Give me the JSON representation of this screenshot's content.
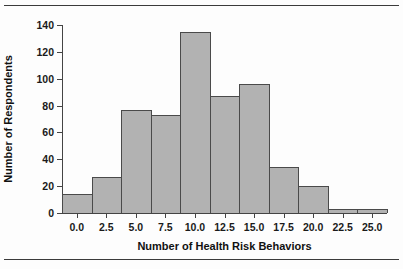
{
  "figure": {
    "background_color": "#fdfdfd",
    "rule_color": "#3b3b3b"
  },
  "chart_data": {
    "type": "bar",
    "title": "",
    "subtitle": "",
    "xlabel": "Number of Health Risk Behaviors",
    "ylabel": "Number of Respondents",
    "bin_width": 2.5,
    "bin_starts": [
      -1.25,
      1.25,
      3.75,
      6.25,
      8.75,
      11.25,
      13.75,
      16.25,
      18.75,
      21.25,
      23.75
    ],
    "bin_centers": [
      0.0,
      2.5,
      5.0,
      7.5,
      10.0,
      12.5,
      15.0,
      17.5,
      20.0,
      22.5,
      25.0
    ],
    "categories": [
      "0.0",
      "2.5",
      "5.0",
      "7.5",
      "10.0",
      "12.5",
      "15.0",
      "17.5",
      "20.0",
      "22.5",
      "25.0"
    ],
    "values": [
      14,
      27,
      77,
      73,
      135,
      87,
      96,
      34,
      20,
      3,
      3
    ],
    "xlim": [
      -1.25,
      26.25
    ],
    "ylim": [
      0,
      140
    ],
    "xticks": [
      0.0,
      2.5,
      5.0,
      7.5,
      10.0,
      12.5,
      15.0,
      17.5,
      20.0,
      22.5,
      25.0
    ],
    "xtick_labels": [
      "0.0",
      "2.5",
      "5.0",
      "7.5",
      "10.0",
      "12.5",
      "15.0",
      "17.5",
      "20.0",
      "22.5",
      "25.0"
    ],
    "yticks": [
      0,
      20,
      40,
      60,
      80,
      100,
      120,
      140
    ],
    "ytick_labels": [
      "0",
      "20",
      "40",
      "60",
      "80",
      "100",
      "120",
      "140"
    ],
    "grid": false,
    "legend": null,
    "bar_fill_color": "#b2b2b2",
    "bar_edge_color": "#4a4a4a",
    "axis_color": "#444444"
  }
}
